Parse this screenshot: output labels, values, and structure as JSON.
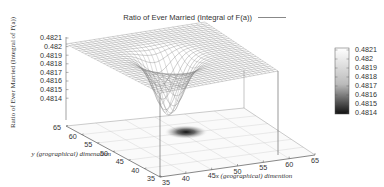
{
  "chart_data": {
    "type": "surface3d",
    "title": "Ratio of Ever Married (Integral of F(a))",
    "legend": {
      "entries": [
        "Ratio of Ever Married (Integral of F(a))"
      ],
      "position": "top-right"
    },
    "zlabel": "Ratio of Ever Married (Integral of F(a))",
    "xlabel": "x (geographical) dimention",
    "ylabel": "y (grographical) dimenation",
    "x_ticks": [
      "35",
      "40",
      "45",
      "50",
      "55",
      "60",
      "65"
    ],
    "y_ticks": [
      "35",
      "40",
      "45",
      "50",
      "55",
      "60",
      "65"
    ],
    "z_ticks": [
      "0.4814",
      "0.4815",
      "0.4816",
      "0.4817",
      "0.4818",
      "0.4819",
      "0.482",
      "0.4821"
    ],
    "xlim": [
      35,
      65
    ],
    "ylim": [
      35,
      65
    ],
    "zlim": [
      0.4814,
      0.4821
    ],
    "colorbar": {
      "ticks": [
        "0.4821",
        "0.482",
        "0.4819",
        "0.4818",
        "0.4817",
        "0.4816",
        "0.4815",
        "0.4814"
      ],
      "range": [
        0.4814,
        0.4821
      ],
      "colormap": "grayscale"
    },
    "surface": {
      "baseline_value": 0.48205,
      "dip": {
        "center_x": 48,
        "center_y": 50,
        "min_value": 0.4814,
        "width": 4
      }
    },
    "projection_map": {
      "plane": "bottom",
      "darkest_at": {
        "x": 48,
        "y": 50
      }
    },
    "grid": true
  }
}
